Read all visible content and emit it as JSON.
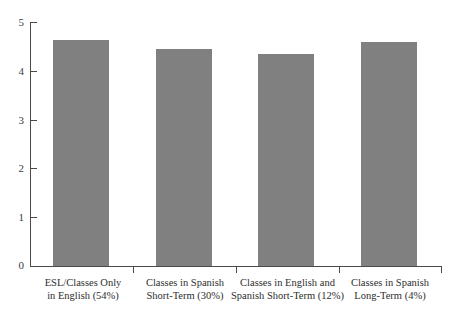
{
  "chart_data": {
    "type": "bar",
    "title": "",
    "subtitle": "",
    "xlabel": "",
    "ylabel": "",
    "ylim": [
      0,
      5
    ],
    "yticks": [
      0,
      1,
      2,
      3,
      4,
      5
    ],
    "grid": false,
    "legend": null,
    "bar_color": "#808080",
    "axis_color": "#4a4a4a",
    "background": "#ffffff",
    "categories": [
      "ESL/Classes Only in English (54%)",
      "Classes in Spanish Short-Term (30%)",
      "Classes in English and Spanish Short-Term (12%)",
      "Classes in Spanish Long-Term (4%)"
    ],
    "category_lines": [
      [
        "ESL/Classes Only",
        "in English (54%)"
      ],
      [
        "Classes in Spanish",
        "Short-Term (30%)"
      ],
      [
        "Classes in English and",
        "Spanish Short-Term (12%)"
      ],
      [
        "Classes in Spanish",
        "Long-Term (4%)"
      ]
    ],
    "values": [
      4.63,
      4.45,
      4.35,
      4.6
    ]
  }
}
